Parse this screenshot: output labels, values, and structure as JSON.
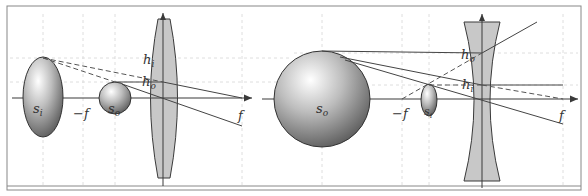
{
  "figure": {
    "panels": [
      {
        "name": "converging-lens",
        "lens_type": "convex",
        "labels": {
          "image": "s",
          "image_sub": "i",
          "object": "s",
          "object_sub": "o",
          "h_image": "h",
          "h_image_sub": "i",
          "h_object": "h",
          "h_object_sub": "o",
          "neg_focal": "−f",
          "focal": "f"
        }
      },
      {
        "name": "diverging-lens",
        "lens_type": "concave",
        "labels": {
          "object": "s",
          "object_sub": "o",
          "image": "s",
          "image_sub": "i",
          "h_object": "h",
          "h_object_sub": "o",
          "h_image": "h",
          "h_image_sub": "i",
          "neg_focal": "−f",
          "focal": "f"
        }
      }
    ],
    "colors": {
      "lens_fill": "#c8c8c8",
      "stroke": "#3a3a3a",
      "grid": "#d8d8d8",
      "frame": "#888888"
    }
  }
}
